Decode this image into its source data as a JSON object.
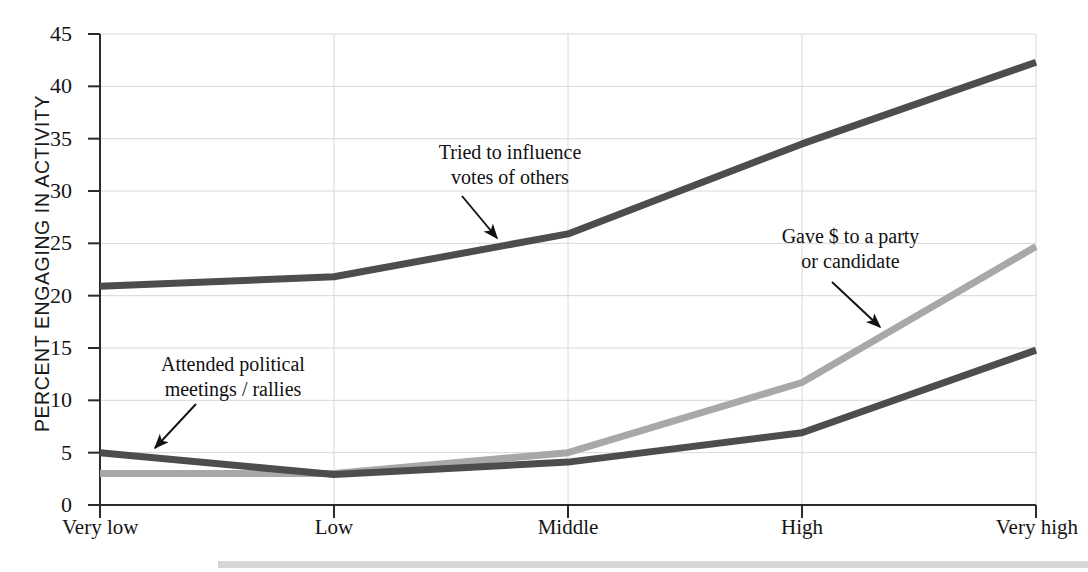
{
  "chart_data": {
    "type": "line",
    "title": "",
    "xlabel": "",
    "ylabel": "PERCENT ENGAGING IN ACTIVITY",
    "categories": [
      "Very low",
      "Low",
      "Middle",
      "High",
      "Very high"
    ],
    "ylim": [
      0,
      45
    ],
    "yticks": [
      0,
      5,
      10,
      15,
      20,
      25,
      30,
      35,
      40,
      45
    ],
    "grid": true,
    "legend_position": "inline-annotations",
    "series": [
      {
        "name": "Tried to influence votes of others",
        "color": "#4d4d4d",
        "values": [
          20.9,
          21.8,
          25.9,
          34.5,
          42.3
        ]
      },
      {
        "name": "Gave $ to a party or candidate",
        "color": "#a8a8a8",
        "values": [
          3.0,
          3.0,
          5.0,
          11.7,
          24.7
        ]
      },
      {
        "name": "Attended political meetings / rallies",
        "color": "#4d4d4d",
        "values": [
          5.0,
          2.9,
          4.1,
          6.9,
          14.8
        ]
      }
    ],
    "annotations": [
      {
        "id": "attended",
        "text_lines": [
          "Attended political",
          "meetings / rallies"
        ],
        "target_category": "Very low",
        "target_value": 4.6
      },
      {
        "id": "influence",
        "text_lines": [
          "Tried to influence",
          "votes of others"
        ],
        "target_category": "Middle",
        "target_value": 24.8
      },
      {
        "id": "gave",
        "text_lines": [
          "Gave $ to a party",
          "or candidate"
        ],
        "target_category": "High",
        "target_value": 16.6
      }
    ]
  },
  "axis": {
    "y_tick_labels": [
      "0",
      "5",
      "10",
      "15",
      "20",
      "25",
      "30",
      "35",
      "40",
      "45"
    ],
    "x_tick_labels": [
      "Very low",
      "Low",
      "Middle",
      "High",
      "Very high"
    ],
    "y_axis_title": "PERCENT ENGAGING IN ACTIVITY"
  },
  "annotations_text": {
    "attended_line1": "Attended political",
    "attended_line2": "meetings / rallies",
    "influence_line1": "Tried to influence",
    "influence_line2": "votes of others",
    "gave_line1": "Gave $ to a party",
    "gave_line2": "or candidate"
  },
  "colors": {
    "series_dark": "#4d4d4d",
    "series_light": "#a8a8a8",
    "axis": "#2b2b2b",
    "grid": "#d8d8d8",
    "text": "#141414",
    "background": "#ffffff"
  }
}
